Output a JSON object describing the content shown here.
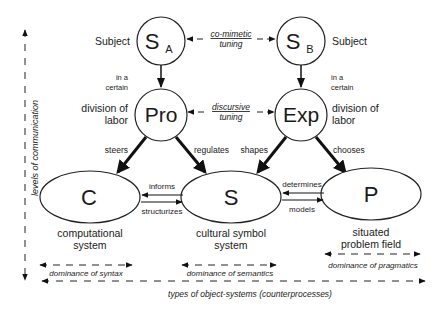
{
  "nodes": {
    "subject_a": {
      "main": "S",
      "sub": "A",
      "label": "Subject"
    },
    "subject_b": {
      "main": "S",
      "sub": "B",
      "label": "Subject"
    },
    "pro": {
      "main": "Pro",
      "label_line1": "division of",
      "label_line2": "labor"
    },
    "exp": {
      "main": "Exp",
      "label_line1": "division of",
      "label_line2": "labor"
    },
    "c": {
      "main": "C",
      "caption_line1": "computational",
      "caption_line2": "system"
    },
    "s": {
      "main": "S",
      "caption_line1": "cultural symbol",
      "caption_line2": "system"
    },
    "p": {
      "main": "P",
      "caption_line1": "situated",
      "caption_line2": "problem field"
    }
  },
  "edges": {
    "in_certain_left_1": "in a",
    "in_certain_left_2": "certain",
    "in_certain_right_1": "in a",
    "in_certain_right_2": "certain",
    "co_mimetic_1": "co-mimetic",
    "co_mimetic_2": "tuning",
    "discursive_1": "discursive",
    "discursive_2": "tuning",
    "steers": "steers",
    "regulates": "regulates",
    "shapes": "shapes",
    "chooses": "chooses",
    "informs": "informs",
    "structurizes": "structurizes",
    "determines": "determines",
    "models": "models"
  },
  "axes": {
    "vertical": "levels of communication",
    "horizontal": "types of object-systems (counterprocesses)",
    "dominance_syntax": "dominance of syntax",
    "dominance_semantics": "dominance of semantics",
    "dominance_pragmatics": "dominance of pragmatics"
  }
}
